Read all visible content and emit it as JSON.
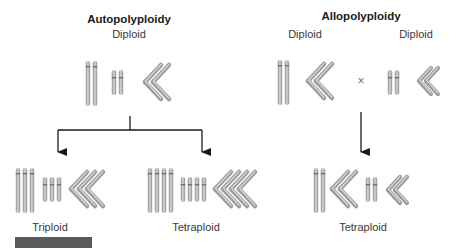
{
  "diagram": {
    "colors": {
      "chromosome_fill": "#b4b4b4",
      "chromosome_shade": "#8a8a8a",
      "chromosome_highlight": "#dcdcdc",
      "arrow": "#1a1a1a",
      "footer_bar": "#5a5a5a"
    },
    "autopolyploidy": {
      "title": "Autopolyploidy",
      "parent_label": "Diploid",
      "outcomes": [
        {
          "label": "Triploid",
          "copies": 3
        },
        {
          "label": "Tetraploid",
          "copies": 4
        }
      ]
    },
    "allopolyploidy": {
      "title": "Allopolyploidy",
      "parents": [
        {
          "label": "Diploid"
        },
        {
          "label": "Diploid"
        }
      ],
      "cross_symbol": "×",
      "outcome": {
        "label": "Tetraploid"
      }
    }
  }
}
